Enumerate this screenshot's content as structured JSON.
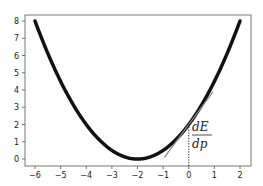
{
  "chart_data": {
    "type": "line",
    "title": "",
    "xlabel": "",
    "ylabel": "",
    "xlim": [
      -6.4,
      2.4
    ],
    "ylim": [
      -0.3,
      8.4
    ],
    "grid": false,
    "xticks": [
      -6,
      -5,
      -4,
      -3,
      -2,
      -1,
      0,
      1,
      2
    ],
    "yticks": [
      0,
      1,
      2,
      3,
      4,
      5,
      6,
      7,
      8
    ],
    "xtick_labels": [
      "−6",
      "−5",
      "−4",
      "−3",
      "−2",
      "−1",
      "0",
      "1",
      "2"
    ],
    "ytick_labels": [
      "0",
      "1",
      "2",
      "3",
      "4",
      "5",
      "6",
      "7",
      "8"
    ],
    "series": [
      {
        "name": "E(p)",
        "style": "thick-black",
        "function": "0.5*(x+2)^2",
        "x": [
          -6,
          -5,
          -4,
          -3,
          -2,
          -1,
          0,
          1,
          2
        ],
        "values": [
          8,
          4.5,
          2,
          0.5,
          0,
          0.5,
          2,
          4.5,
          8
        ]
      },
      {
        "name": "tangent",
        "style": "thin-gray",
        "x": [
          -0.95,
          0.95
        ],
        "values": [
          0.1,
          3.9
        ]
      },
      {
        "name": "vertical-marker",
        "style": "dotted",
        "x": [
          0,
          0
        ],
        "values": [
          0,
          2
        ]
      }
    ],
    "annotations": [
      {
        "text_num": "dE",
        "text_den": "dp",
        "x": 0.05,
        "y": 1.5
      }
    ]
  },
  "annotation": {
    "numerator": "dE",
    "denominator": "dp"
  },
  "colors": {
    "curve": "#111111",
    "tangent": "#888888",
    "axes": "#555555"
  }
}
